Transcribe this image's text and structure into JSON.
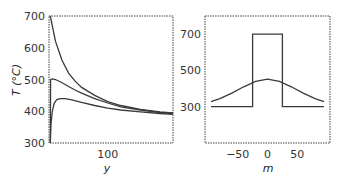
{
  "chart_data": [
    {
      "type": "line",
      "title": "",
      "xlabel": "y",
      "ylabel": "T (°C)",
      "xlim": [
        10,
        200
      ],
      "ylim": [
        300,
        700
      ],
      "xticks": [
        100
      ],
      "yticks": [
        300,
        400,
        500,
        600,
        700
      ],
      "grid": false,
      "legend": null,
      "series": [
        {
          "name": "upper",
          "x": [
            12,
            20,
            30,
            40,
            50,
            60,
            80,
            100,
            120,
            150,
            180,
            200
          ],
          "values": [
            700,
            620,
            560,
            520,
            495,
            475,
            450,
            430,
            418,
            406,
            398,
            395
          ]
        },
        {
          "name": "middle",
          "x": [
            12,
            12.5,
            15,
            20,
            30,
            40,
            50,
            60,
            80,
            100,
            120,
            150,
            180,
            200
          ],
          "values": [
            300,
            500,
            502,
            500,
            490,
            478,
            467,
            457,
            440,
            426,
            414,
            404,
            396,
            393
          ]
        },
        {
          "name": "lower",
          "x": [
            12,
            13,
            15,
            18,
            22,
            28,
            35,
            45,
            60,
            80,
            100,
            120,
            150,
            180,
            200
          ],
          "values": [
            300,
            360,
            400,
            425,
            437,
            440,
            440,
            436,
            428,
            418,
            410,
            404,
            398,
            393,
            390
          ]
        }
      ]
    },
    {
      "type": "line",
      "title": "",
      "xlabel": "m",
      "ylabel": "",
      "xlim": [
        -105,
        105
      ],
      "ylim": [
        100,
        800
      ],
      "xticks": [
        -50,
        0,
        50
      ],
      "yticks": [
        300,
        500,
        700
      ],
      "grid": false,
      "legend": null,
      "series": [
        {
          "name": "step",
          "x": [
            -95,
            -25,
            -25,
            25,
            25,
            95
          ],
          "values": [
            300,
            300,
            700,
            700,
            300,
            300
          ]
        },
        {
          "name": "gaussian",
          "x": [
            -95,
            -80,
            -60,
            -40,
            -20,
            0,
            20,
            40,
            60,
            80,
            95
          ],
          "values": [
            328,
            345,
            375,
            410,
            440,
            452,
            440,
            410,
            375,
            345,
            328
          ]
        }
      ]
    }
  ],
  "labels": {
    "left_ylabel": "T (°C)",
    "left_xlabel": "y",
    "right_xlabel": "m"
  }
}
